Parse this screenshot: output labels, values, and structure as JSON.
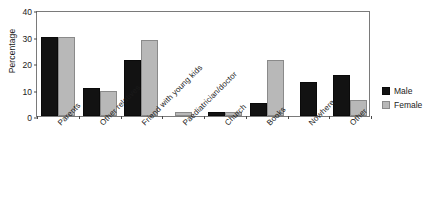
{
  "title_sliver": "",
  "chart_data": {
    "type": "bar",
    "title": "",
    "xlabel": "",
    "ylabel": "Percentage",
    "ylim": [
      0,
      40
    ],
    "yticks": [
      0,
      10,
      20,
      30,
      40
    ],
    "ytick_labels": [
      "0",
      "10",
      "20",
      "30",
      "40"
    ],
    "grid": false,
    "legend_position": "right",
    "categories": [
      "Parents",
      "Other relatives",
      "Friend with young kids",
      "Paediatrician/doctor",
      "Church",
      "Books",
      "Nowhere",
      "Other"
    ],
    "series": [
      {
        "name": "Male",
        "color": "#121212",
        "values": [
          30,
          10.5,
          21,
          0,
          1.5,
          5,
          13,
          15.5
        ]
      },
      {
        "name": "Female",
        "color": "#b8b8b8",
        "values": [
          30,
          9.5,
          28.5,
          1.5,
          1.5,
          21,
          0,
          6
        ]
      }
    ]
  },
  "legend": {
    "entries": [
      {
        "label": "Male",
        "swatch": "male"
      },
      {
        "label": "Female",
        "swatch": "female"
      }
    ]
  }
}
